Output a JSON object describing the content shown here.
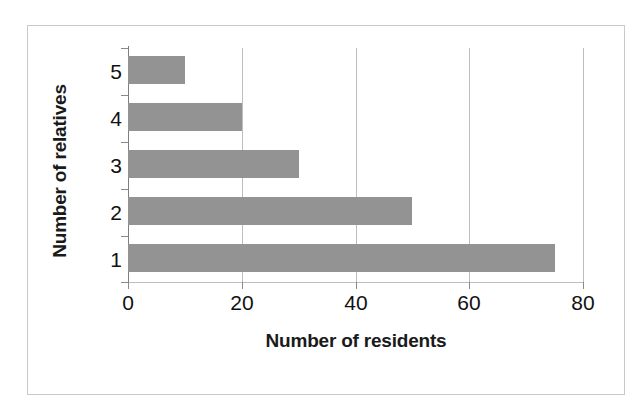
{
  "chart_data": {
    "type": "bar",
    "orientation": "horizontal",
    "title": "",
    "xlabel": "Number of residents",
    "ylabel": "Number of relatives",
    "categories": [
      "1",
      "2",
      "3",
      "4",
      "5"
    ],
    "values": [
      75,
      50,
      30,
      20,
      10
    ],
    "series": [
      {
        "name": "Number of residents",
        "values": [
          75,
          50,
          30,
          20,
          10
        ]
      }
    ],
    "points": [
      {
        "category": "5",
        "value": 10
      },
      {
        "category": "4",
        "value": 20
      },
      {
        "category": "3",
        "value": 30
      },
      {
        "category": "2",
        "value": 50
      },
      {
        "category": "1",
        "value": 75
      }
    ],
    "xlim": [
      0,
      80
    ],
    "xticks": [
      0,
      20,
      40,
      60,
      80
    ],
    "xtick_labels": [
      "0",
      "20",
      "40",
      "60",
      "80"
    ],
    "ytick_labels": [
      "5",
      "4",
      "3",
      "2",
      "1"
    ],
    "grid": "vertical",
    "legend": "none",
    "bar_color": "#939393",
    "gridline_color": "#bdbdbd",
    "axis_color": "#8a8a8a",
    "text_color": "#111111",
    "background": "#ffffff",
    "border_color": "#c9c9c9"
  }
}
